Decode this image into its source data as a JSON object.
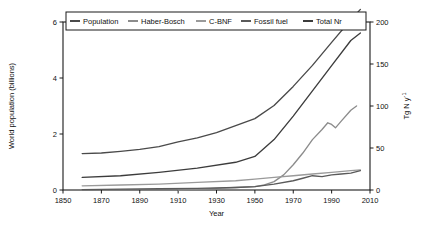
{
  "chart_data": {
    "type": "line",
    "title": "",
    "xlabel": "Year",
    "ylabel": "World population (billions)",
    "ylabel_right": "Tg N y",
    "ylabel_right_sup": "-1",
    "xlim": [
      1850,
      2010
    ],
    "ylim": [
      0,
      6
    ],
    "ylim_right": [
      0,
      200
    ],
    "xticks": [
      1850,
      1870,
      1890,
      1910,
      1930,
      1950,
      1970,
      1990,
      2010
    ],
    "yticks": [
      0,
      2,
      4,
      6
    ],
    "yticks_right": [
      0,
      50,
      100,
      150,
      200
    ],
    "grid": false,
    "legend_position": "top",
    "colors": {
      "population": "#4a4a4a",
      "haber_bosch": "#8c8c8c",
      "c_bnf": "#9a9a9a",
      "fossil_fuel": "#5a5a5a",
      "total_nr": "#3c3c3c"
    },
    "series": [
      {
        "name": "Population",
        "axis": "left",
        "color": "#4a4a4a",
        "x": [
          1860,
          1870,
          1880,
          1890,
          1900,
          1910,
          1920,
          1930,
          1940,
          1950,
          1960,
          1970,
          1980,
          1990,
          2000,
          2005
        ],
        "values": [
          1.3,
          1.32,
          1.38,
          1.45,
          1.55,
          1.72,
          1.86,
          2.05,
          2.3,
          2.55,
          3.02,
          3.7,
          4.45,
          5.27,
          6.08,
          6.45
        ]
      },
      {
        "name": "Haber-Bosch",
        "axis": "right",
        "color": "#8c8c8c",
        "x": [
          1910,
          1920,
          1930,
          1940,
          1950,
          1955,
          1960,
          1965,
          1970,
          1975,
          1980,
          1985,
          1988,
          1990,
          1992,
          1995,
          2000,
          2003
        ],
        "values": [
          0,
          1,
          2,
          3,
          4,
          6,
          10,
          18,
          30,
          44,
          60,
          72,
          80,
          78,
          74,
          82,
          95,
          100
        ]
      },
      {
        "name": "C-BNF",
        "axis": "right",
        "color": "#9a9a9a",
        "x": [
          1860,
          1880,
          1900,
          1920,
          1940,
          1950,
          1960,
          1970,
          1980,
          1990,
          2000,
          2005
        ],
        "values": [
          5,
          6,
          7,
          9,
          11,
          13,
          15,
          17,
          19,
          21,
          23,
          24
        ]
      },
      {
        "name": "Fossil fuel",
        "axis": "right",
        "color": "#5a5a5a",
        "x": [
          1860,
          1880,
          1900,
          1920,
          1940,
          1950,
          1960,
          1970,
          1975,
          1980,
          1985,
          1990,
          1995,
          2000,
          2005
        ],
        "values": [
          0.5,
          1,
          1.5,
          2,
          3,
          4,
          7,
          11,
          14,
          17,
          16,
          18,
          19,
          20,
          23
        ]
      },
      {
        "name": "Total Nr",
        "axis": "right",
        "color": "#3c3c3c",
        "x": [
          1860,
          1880,
          1900,
          1920,
          1940,
          1950,
          1960,
          1970,
          1980,
          1990,
          2000,
          2005
        ],
        "values": [
          15,
          17,
          21,
          26,
          33,
          40,
          60,
          88,
          118,
          148,
          178,
          187
        ]
      }
    ],
    "legend": [
      {
        "label": "Population",
        "color": "#4a4a4a"
      },
      {
        "label": "Haber-Bosch",
        "color": "#8c8c8c"
      },
      {
        "label": "C-BNF",
        "color": "#9a9a9a"
      },
      {
        "label": "Fossil fuel",
        "color": "#5a5a5a"
      },
      {
        "label": "Total Nr",
        "color": "#3c3c3c"
      }
    ]
  }
}
